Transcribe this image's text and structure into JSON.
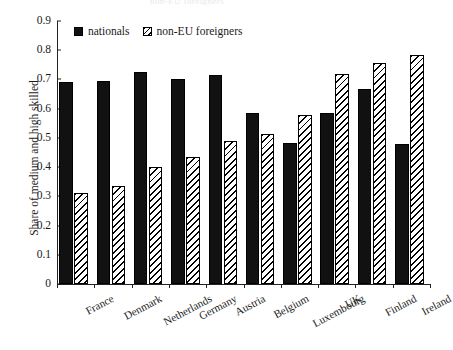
{
  "figure": {
    "ghost_title": "non-EU foreigners",
    "background": "#ffffff",
    "ink": "#111111"
  },
  "legend": {
    "position": "top-left-inside",
    "items": [
      {
        "label": "nationals",
        "style": "solid-black",
        "color": "#111111"
      },
      {
        "label": "non-EU foreigners",
        "style": "diagonal-hatch",
        "color": "#000000"
      }
    ]
  },
  "chart_data": {
    "type": "bar",
    "title": "",
    "subtitle": "",
    "xlabel": "",
    "ylabel": "Share of medium and high skilled",
    "ylim": [
      0,
      0.9
    ],
    "ytick_labels": [
      "0",
      "0.1",
      "0.2",
      "0.3",
      "0.4",
      "0.5",
      "0.6",
      "0.7",
      "0.8",
      "0.9"
    ],
    "ytick_values": [
      0,
      0.1,
      0.2,
      0.3,
      0.4,
      0.5,
      0.6,
      0.7,
      0.8,
      0.9
    ],
    "grid": false,
    "legend_position": "upper left",
    "categories": [
      "France",
      "Denmark",
      "Netherlands",
      "Germany",
      "Austria",
      "Belgium",
      "Luxembourg",
      "UK",
      "Finland",
      "Ireland"
    ],
    "series": [
      {
        "name": "nationals",
        "color": "#111111",
        "values": [
          0.69,
          0.695,
          0.725,
          0.703,
          0.714,
          0.585,
          0.483,
          0.585,
          0.667,
          0.479
        ]
      },
      {
        "name": "non-EU foreigners",
        "color": "#000000",
        "values": [
          0.311,
          0.335,
          0.4,
          0.436,
          0.49,
          0.513,
          0.578,
          0.717,
          0.755,
          0.784
        ]
      }
    ]
  }
}
